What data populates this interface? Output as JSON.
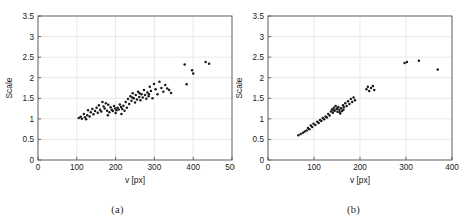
{
  "figure": {
    "background": "#ffffff",
    "marker_color": "#1a1a1a",
    "axis_color": "#4d4d4d",
    "grid_color": "#d9d9d9"
  },
  "panels": [
    {
      "key": "a",
      "caption": "(a)",
      "xlabel": "v [px]",
      "ylabel": "Scale",
      "xticks": [
        "0",
        "100",
        "200",
        "300",
        "400",
        "500"
      ],
      "yticks": [
        "0",
        "0.5",
        "1",
        "1.5",
        "2",
        "2.5",
        "3",
        "3.5"
      ]
    },
    {
      "key": "b",
      "caption": "(b)",
      "xlabel": "v [px]",
      "ylabel": "Scale",
      "xticks": [
        "0",
        "100",
        "200",
        "300",
        "400"
      ],
      "yticks": [
        "0",
        "0.5",
        "1",
        "1.5",
        "2",
        "2.5",
        "3",
        "3.5"
      ]
    }
  ],
  "chart_data": [
    {
      "type": "scatter",
      "panel": "a",
      "title": "",
      "xlabel": "v [px]",
      "ylabel": "Scale",
      "xlim": [
        0,
        500
      ],
      "ylim": [
        0,
        3.5
      ],
      "xticks": [
        0,
        100,
        200,
        300,
        400,
        500
      ],
      "yticks": [
        0,
        0.5,
        1,
        1.5,
        2,
        2.5,
        3,
        3.5
      ],
      "grid": true,
      "legend": null,
      "marker": "dot",
      "points": [
        [
          105,
          1.02
        ],
        [
          110,
          1.05
        ],
        [
          113,
          1.0
        ],
        [
          118,
          1.12
        ],
        [
          121,
          1.04
        ],
        [
          124,
          0.99
        ],
        [
          127,
          1.09
        ],
        [
          129,
          1.21
        ],
        [
          133,
          1.06
        ],
        [
          136,
          1.16
        ],
        [
          140,
          1.24
        ],
        [
          143,
          1.11
        ],
        [
          147,
          1.19
        ],
        [
          151,
          1.27
        ],
        [
          154,
          1.15
        ],
        [
          157,
          1.33
        ],
        [
          160,
          1.22
        ],
        [
          163,
          1.18
        ],
        [
          166,
          1.41
        ],
        [
          169,
          1.3
        ],
        [
          172,
          1.25
        ],
        [
          175,
          1.38
        ],
        [
          178,
          1.2
        ],
        [
          181,
          1.34
        ],
        [
          184,
          1.16
        ],
        [
          187,
          1.28
        ],
        [
          190,
          1.22
        ],
        [
          193,
          1.19
        ],
        [
          196,
          1.31
        ],
        [
          199,
          1.25
        ],
        [
          202,
          1.21
        ],
        [
          205,
          1.27
        ],
        [
          208,
          1.23
        ],
        [
          211,
          1.35
        ],
        [
          214,
          1.29
        ],
        [
          217,
          1.24
        ],
        [
          220,
          1.32
        ],
        [
          223,
          1.2
        ],
        [
          226,
          1.41
        ],
        [
          229,
          1.27
        ],
        [
          232,
          1.48
        ],
        [
          235,
          1.36
        ],
        [
          238,
          1.55
        ],
        [
          241,
          1.44
        ],
        [
          244,
          1.62
        ],
        [
          247,
          1.5
        ],
        [
          250,
          1.4
        ],
        [
          252,
          1.58
        ],
        [
          255,
          1.47
        ],
        [
          258,
          1.66
        ],
        [
          261,
          1.53
        ],
        [
          264,
          1.45
        ],
        [
          267,
          1.6
        ],
        [
          270,
          1.52
        ],
        [
          273,
          1.7
        ],
        [
          276,
          1.58
        ],
        [
          279,
          1.49
        ],
        [
          282,
          1.64
        ],
        [
          285,
          1.55
        ],
        [
          288,
          1.78
        ],
        [
          291,
          1.68
        ],
        [
          295,
          1.5
        ],
        [
          299,
          1.85
        ],
        [
          303,
          1.72
        ],
        [
          308,
          1.6
        ],
        [
          313,
          1.9
        ],
        [
          318,
          1.75
        ],
        [
          323,
          1.66
        ],
        [
          328,
          1.82
        ],
        [
          333,
          1.74
        ],
        [
          338,
          1.7
        ],
        [
          343,
          1.63
        ],
        [
          378,
          2.32
        ],
        [
          383,
          1.84
        ],
        [
          397,
          2.18
        ],
        [
          400,
          2.1
        ],
        [
          432,
          2.38
        ],
        [
          441,
          2.34
        ],
        [
          180,
          1.09
        ],
        [
          200,
          1.14
        ],
        [
          215,
          1.12
        ],
        [
          243,
          1.52
        ],
        [
          262,
          1.62
        ],
        [
          286,
          1.6
        ]
      ]
    },
    {
      "type": "scatter",
      "panel": "b",
      "title": "",
      "xlabel": "v [px]",
      "ylabel": "Scale",
      "xlim": [
        0,
        400
      ],
      "ylim": [
        0,
        3.5
      ],
      "xticks": [
        0,
        100,
        200,
        300,
        400
      ],
      "yticks": [
        0,
        0.5,
        1,
        1.5,
        2,
        2.5,
        3,
        3.5
      ],
      "grid": true,
      "legend": null,
      "marker": "dot",
      "points": [
        [
          66,
          0.6
        ],
        [
          71,
          0.63
        ],
        [
          76,
          0.66
        ],
        [
          80,
          0.69
        ],
        [
          84,
          0.72
        ],
        [
          87,
          0.78
        ],
        [
          90,
          0.75
        ],
        [
          93,
          0.84
        ],
        [
          96,
          0.8
        ],
        [
          99,
          0.88
        ],
        [
          103,
          0.85
        ],
        [
          107,
          0.93
        ],
        [
          110,
          0.9
        ],
        [
          113,
          0.97
        ],
        [
          116,
          0.95
        ],
        [
          119,
          1.02
        ],
        [
          122,
          0.99
        ],
        [
          125,
          1.06
        ],
        [
          128,
          1.03
        ],
        [
          131,
          1.12
        ],
        [
          134,
          1.08
        ],
        [
          137,
          1.18
        ],
        [
          139,
          1.23
        ],
        [
          141,
          1.15
        ],
        [
          143,
          1.27
        ],
        [
          145,
          1.2
        ],
        [
          147,
          1.31
        ],
        [
          149,
          1.24
        ],
        [
          151,
          1.17
        ],
        [
          153,
          1.29
        ],
        [
          155,
          1.22
        ],
        [
          157,
          1.13
        ],
        [
          159,
          1.26
        ],
        [
          161,
          1.19
        ],
        [
          163,
          1.33
        ],
        [
          165,
          1.28
        ],
        [
          168,
          1.38
        ],
        [
          171,
          1.31
        ],
        [
          174,
          1.43
        ],
        [
          177,
          1.36
        ],
        [
          180,
          1.48
        ],
        [
          183,
          1.41
        ],
        [
          186,
          1.52
        ],
        [
          189,
          1.45
        ],
        [
          214,
          1.72
        ],
        [
          217,
          1.78
        ],
        [
          220,
          1.68
        ],
        [
          224,
          1.75
        ],
        [
          228,
          1.8
        ],
        [
          231,
          1.7
        ],
        [
          297,
          2.36
        ],
        [
          302,
          2.38
        ],
        [
          328,
          2.41
        ],
        [
          369,
          2.2
        ],
        [
          143,
          1.21
        ],
        [
          150,
          1.25
        ],
        [
          156,
          1.16
        ],
        [
          164,
          1.22
        ]
      ]
    }
  ]
}
